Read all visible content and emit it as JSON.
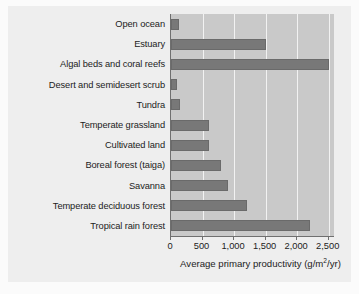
{
  "chart_data": {
    "type": "bar",
    "orientation": "horizontal",
    "title": "",
    "xlabel": "Average primary productivity (g/m2/yr)",
    "xlabel_parts": {
      "before": "Average primary productivity (g/m",
      "superscript": "2",
      "after": "/yr)"
    },
    "ylabel": "",
    "xlim": [
      0,
      2600
    ],
    "xticks": [
      0,
      500,
      1000,
      1500,
      2000,
      2500
    ],
    "xtick_labels": [
      "0",
      "500",
      "1,000",
      "1,500",
      "2,000",
      "2,500"
    ],
    "grid": "vertical",
    "legend": "none",
    "categories": [
      "Open ocean",
      "Estuary",
      "Algal beds and coral reefs",
      "Desert and semidesert scrub",
      "Tundra",
      "Temperate grassland",
      "Cultivated land",
      "Boreal forest (taiga)",
      "Savanna",
      "Temperate deciduous forest",
      "Tropical rain forest"
    ],
    "values": [
      125,
      1500,
      2500,
      90,
      140,
      600,
      600,
      800,
      900,
      1200,
      2200
    ],
    "series": [
      {
        "name": "Average primary productivity",
        "values": [
          125,
          1500,
          2500,
          90,
          140,
          600,
          600,
          800,
          900,
          1200,
          2200
        ]
      }
    ],
    "colors": {
      "bar": "#787878",
      "plot_background": "#c9c9c9",
      "gridline": "#f2f2f2",
      "axis": "#6f6f6f",
      "panel_background": "#eeeeee",
      "text": "#1c1c1c"
    }
  }
}
